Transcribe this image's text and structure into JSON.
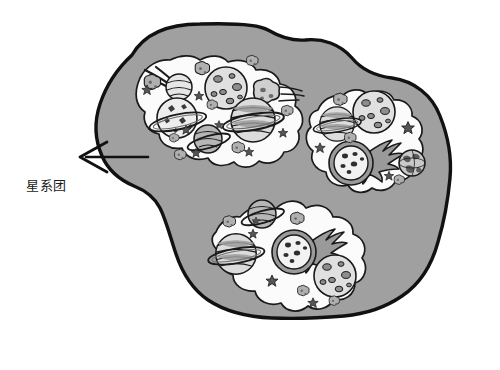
{
  "diagram": {
    "title_label": "星系团",
    "label_meaning": "galaxy cluster",
    "background_color": "#ffffff",
    "outline_color": "#111111",
    "supercluster_fill": "#a0a0a0",
    "cluster_fill": "#fbfbfb",
    "body_fill_light": "#e8e8e8",
    "body_fill_mid": "#b9b9b9",
    "body_fill_dark": "#8d8d8d",
    "annotation": {
      "arrow_name": "pointer-arrow",
      "arrow_tip_x": 80,
      "arrow_tip_y": 157,
      "arrow_tail_x": 148,
      "arrow_tail_y": 157,
      "label_x": 26,
      "label_y": 187
    },
    "clusters": [
      {
        "name": "cluster-top-left",
        "bodies": [
          {
            "kind": "comet-streak",
            "label": "comet"
          },
          {
            "kind": "cratered-moon",
            "label": "cratered moon"
          },
          {
            "kind": "small-asteroid",
            "label": "asteroid"
          },
          {
            "kind": "speeding-rock",
            "label": "speeding rock"
          },
          {
            "kind": "ringed-planet-spotted",
            "label": "ringed planet"
          },
          {
            "kind": "ringed-planet-banded",
            "label": "banded ringed planet"
          },
          {
            "kind": "ringed-planet-tilted",
            "label": "tilted ringed planet"
          },
          {
            "kind": "star-sparkle",
            "label": "star"
          }
        ]
      },
      {
        "name": "cluster-right",
        "bodies": [
          {
            "kind": "cratered-moon",
            "label": "cratered moon"
          },
          {
            "kind": "ringed-planet-banded",
            "label": "banded ringed planet"
          },
          {
            "kind": "small-asteroid",
            "label": "asteroid"
          },
          {
            "kind": "flaming-comet",
            "label": "flaming comet"
          },
          {
            "kind": "earth-globe",
            "label": "earth-like globe"
          },
          {
            "kind": "star-sparkle",
            "label": "star"
          }
        ]
      },
      {
        "name": "cluster-bottom",
        "bodies": [
          {
            "kind": "ringed-planet-tilted",
            "label": "tilted ringed planet"
          },
          {
            "kind": "ringed-planet-banded",
            "label": "banded ringed planet"
          },
          {
            "kind": "flaming-comet",
            "label": "flaming comet"
          },
          {
            "kind": "cratered-moon",
            "label": "cratered moon"
          },
          {
            "kind": "small-asteroid",
            "label": "asteroid"
          },
          {
            "kind": "star-sparkle",
            "label": "star"
          }
        ]
      }
    ]
  }
}
